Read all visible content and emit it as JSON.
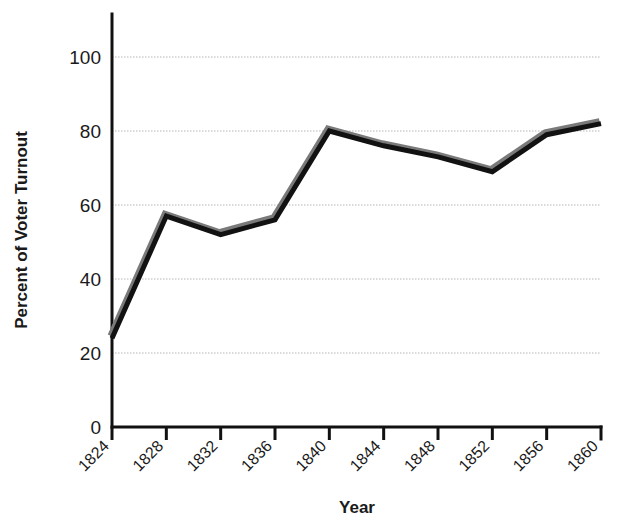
{
  "chart_data": {
    "type": "line",
    "title": "",
    "subtitle": "",
    "xlabel": "Year",
    "ylabel": "Percent of Voter Turnout",
    "categories": [
      1824,
      1828,
      1832,
      1836,
      1840,
      1844,
      1848,
      1852,
      1856,
      1860
    ],
    "x_tick_labels": [
      "1824",
      "1828",
      "1832",
      "1836",
      "1840",
      "1844",
      "1848",
      "1852",
      "1856",
      "1860"
    ],
    "y_tick_labels": [
      "0",
      "20",
      "40",
      "60",
      "80",
      "100"
    ],
    "y_ticks": [
      0,
      20,
      40,
      60,
      80,
      100
    ],
    "xlim": [
      1824,
      1860
    ],
    "ylim": [
      0,
      100
    ],
    "grid": true,
    "grid_axis": "y",
    "legend": false,
    "legend_position": "none",
    "series": [
      {
        "name": "Percent of Voter Turnout",
        "color": "#121212",
        "shadow_color": "#7a7a7a",
        "values": [
          24,
          57,
          52,
          56,
          80,
          76,
          73,
          69,
          79,
          82
        ]
      }
    ]
  },
  "axes": {
    "y_title": "Percent of Voter Turnout",
    "x_title": "Year"
  }
}
